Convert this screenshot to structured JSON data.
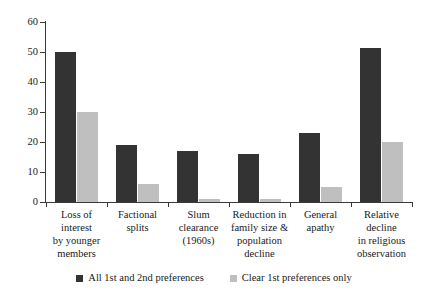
{
  "chart_data": {
    "type": "bar",
    "title": "",
    "xlabel": "",
    "ylabel": "",
    "ylim": [
      0,
      60
    ],
    "yticks": [
      0,
      10,
      20,
      30,
      40,
      50,
      60
    ],
    "grid": false,
    "legend_position": "bottom",
    "categories": [
      "Loss of interest by younger members",
      "Factional splits",
      "Slum clearance (1960s)",
      "Reduction in family size & population decline",
      "General apathy",
      "Relative decline in religious observation"
    ],
    "category_lines": [
      [
        "Loss of interest",
        "by younger",
        "members"
      ],
      [
        "Factional splits"
      ],
      [
        "Slum clearance",
        "(1960s)"
      ],
      [
        "Reduction in",
        "family size &",
        "population",
        "decline"
      ],
      [
        "General apathy"
      ],
      [
        "Relative decline",
        "in religious",
        "observation"
      ]
    ],
    "series": [
      {
        "name": "All 1st and 2nd preferences",
        "color": "#333333",
        "values": [
          50,
          19,
          17,
          16,
          23,
          51.5
        ]
      },
      {
        "name": "Clear 1st preferences only",
        "color": "#bfbfbf",
        "values": [
          30,
          6,
          1,
          1,
          5,
          20
        ]
      }
    ]
  },
  "legend": {
    "items": [
      {
        "label": "All 1st and 2nd preferences",
        "color": "#333333"
      },
      {
        "label": "Clear 1st preferences only",
        "color": "#bfbfbf"
      }
    ]
  },
  "axis": {
    "y_tick_labels": [
      "0",
      "10",
      "20",
      "30",
      "40",
      "50",
      "60"
    ]
  }
}
